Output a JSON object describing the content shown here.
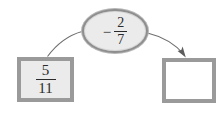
{
  "diagram": {
    "type": "fraction-operation-flow",
    "background_color": "#ffffff",
    "operand": {
      "label": "5/11",
      "numerator": "5",
      "denominator": "11",
      "fill_color": "#ebebeb",
      "border_color": "#9a9a9a"
    },
    "operator": {
      "sign": "−",
      "label": "-2/7",
      "numerator": "2",
      "denominator": "7",
      "fill_color": "#ebebeb",
      "border_color": "#8e8e8e"
    },
    "result": {
      "label": "",
      "fill_color": "#ffffff",
      "border_color": "#9a9a9a"
    },
    "connectors": [
      {
        "name": "operand-to-operator",
        "arrowhead": false,
        "color": "#6f6f6f"
      },
      {
        "name": "operator-to-result",
        "arrowhead": true,
        "color": "#6f6f6f"
      }
    ]
  }
}
